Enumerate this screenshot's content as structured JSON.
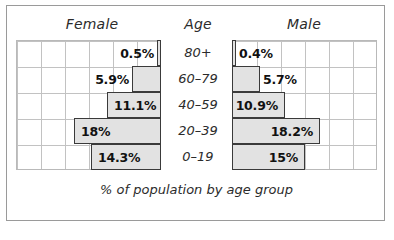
{
  "header": {
    "female": "Female",
    "age": "Age",
    "male": "Male"
  },
  "caption": "% of population by age group",
  "colors": {
    "bar_fill": "#e2e2e2",
    "bar_border": "#3a3a3a",
    "grid_line": "#c2c2c2",
    "frame_border": "#9a9a9a",
    "text": "#2b2b2b"
  },
  "chart_data": {
    "type": "bar",
    "title": "",
    "subtitle": "",
    "xlabel": "% of population by age group",
    "ylabel": "Age",
    "categories": [
      "80+",
      "60–79",
      "40–59",
      "20–39",
      "0–19"
    ],
    "series": [
      {
        "name": "Female",
        "direction": "left",
        "values": [
          0.5,
          5.9,
          11.1,
          18,
          14.3
        ],
        "labels": [
          "0.5%",
          "5.9%",
          "11.1%",
          "18%",
          "14.3%"
        ]
      },
      {
        "name": "Male",
        "direction": "right",
        "values": [
          0.4,
          5.7,
          10.9,
          18.2,
          15
        ],
        "labels": [
          "0.4%",
          "5.7%",
          "10.9%",
          "18.2%",
          "15%"
        ]
      }
    ],
    "xlim": [
      0,
      30
    ],
    "grid": true,
    "gridline_step_percent": 5,
    "legend": "none",
    "orientation": "horizontal",
    "layout": "population-pyramid"
  },
  "rows": [
    {
      "age": "80+",
      "female_label": "0.5%",
      "female_value": 0.5,
      "male_label": "0.4%",
      "male_value": 0.4,
      "female_px": 4,
      "male_px": 4,
      "female_inside": false,
      "male_inside": false
    },
    {
      "age": "60–79",
      "female_label": "5.9%",
      "female_value": 5.9,
      "male_label": "5.7%",
      "male_value": 5.7,
      "female_px": 29,
      "male_px": 28,
      "female_inside": false,
      "male_inside": false
    },
    {
      "age": "40–59",
      "female_label": "11.1%",
      "female_value": 11.1,
      "male_label": "10.9%",
      "male_value": 10.9,
      "female_px": 54,
      "male_px": 53,
      "female_inside": true,
      "male_inside": true
    },
    {
      "age": "20–39",
      "female_label": "18%",
      "female_value": 18,
      "male_label": "18.2%",
      "male_value": 18.2,
      "female_px": 87,
      "male_px": 88,
      "female_inside": true,
      "male_inside": true
    },
    {
      "age": "0–19",
      "female_label": "14.3%",
      "female_value": 14.3,
      "male_label": "15%",
      "male_value": 15,
      "female_px": 70,
      "male_px": 73,
      "female_inside": true,
      "male_inside": true
    }
  ]
}
